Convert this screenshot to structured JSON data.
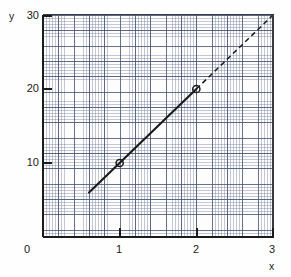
{
  "chart_data": {
    "type": "line",
    "title": "",
    "xlabel": "x",
    "ylabel": "y",
    "xlim": [
      0,
      3
    ],
    "ylim": [
      0,
      30
    ],
    "grid": true,
    "grid_style": "graph-paper, minor cells with heavier line every 5 cells",
    "legend": "none",
    "x_ticks": [
      0,
      1,
      2,
      3
    ],
    "x_tick_labels": [
      "0",
      "1",
      "2",
      "3"
    ],
    "y_ticks": [
      0,
      10,
      20,
      30
    ],
    "y_tick_labels": [
      "0",
      "10",
      "20",
      "30"
    ],
    "series": [
      {
        "name": "fitted line",
        "equation": "y = 10x",
        "slope": 10,
        "intercept": 0,
        "solid_segment": {
          "x": [
            0.6,
            2.0
          ],
          "y": [
            6,
            20
          ]
        },
        "dashed_segment": {
          "x": [
            2.0,
            3.0
          ],
          "y": [
            20,
            30
          ]
        },
        "marker": "open-circle",
        "points": [
          {
            "x": 1,
            "y": 10
          },
          {
            "x": 2,
            "y": 20
          }
        ]
      }
    ]
  },
  "axes": {
    "y_title": "y",
    "x_title": "x",
    "origin_label": "0",
    "y_labels": [
      "30",
      "20",
      "10"
    ],
    "x_labels": [
      "1",
      "2",
      "3"
    ]
  },
  "colors": {
    "line": "#1a1a1a",
    "axis": "#1b1b1b",
    "grid_minor": "#6e7896",
    "grid_major": "#46506e",
    "background": "#fefefe",
    "marker_stroke": "#1a1a1a"
  }
}
